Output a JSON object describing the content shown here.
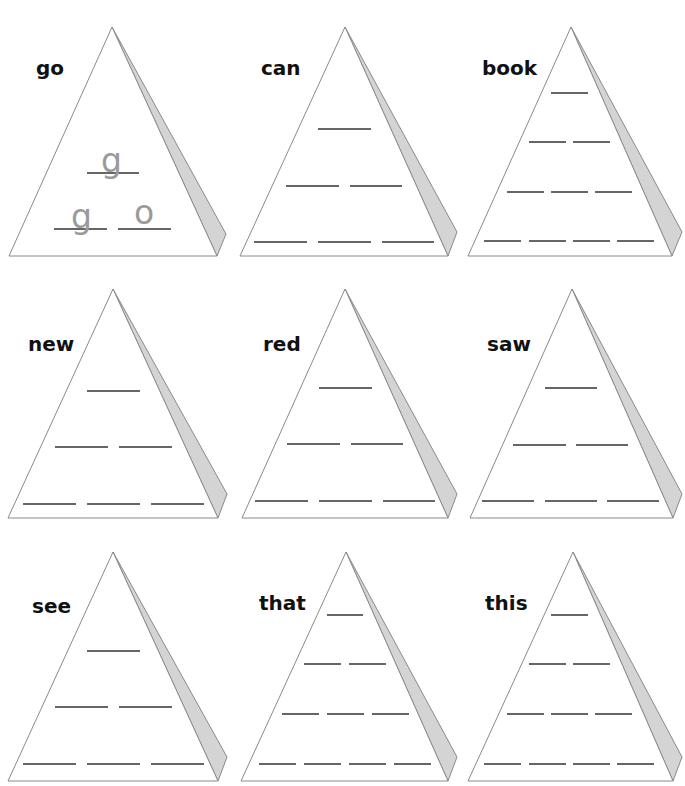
{
  "worksheet": {
    "type": "word pyramid worksheet",
    "colors": {
      "outline": "#8a8a8a",
      "side_face": "#d4d4d4",
      "blank_line": "#333333",
      "word_text": "#111111",
      "hint_letters": "#9a9a9a"
    },
    "pyramids": [
      {
        "word": "go",
        "rows": [
          1,
          2
        ],
        "example": true,
        "hints": [
          [
            "g"
          ],
          [
            "g",
            "o"
          ]
        ]
      },
      {
        "word": "can",
        "rows": [
          1,
          2,
          3
        ],
        "example": false
      },
      {
        "word": "book",
        "rows": [
          1,
          2,
          3,
          4
        ],
        "example": false
      },
      {
        "word": "new",
        "rows": [
          1,
          2,
          3
        ],
        "example": false
      },
      {
        "word": "red",
        "rows": [
          1,
          2,
          3
        ],
        "example": false
      },
      {
        "word": "saw",
        "rows": [
          1,
          2,
          3
        ],
        "example": false
      },
      {
        "word": "see",
        "rows": [
          1,
          2,
          3
        ],
        "example": false
      },
      {
        "word": "that",
        "rows": [
          1,
          2,
          3,
          4
        ],
        "example": false
      },
      {
        "word": "this",
        "rows": [
          1,
          2,
          3,
          4
        ],
        "example": false
      }
    ]
  }
}
